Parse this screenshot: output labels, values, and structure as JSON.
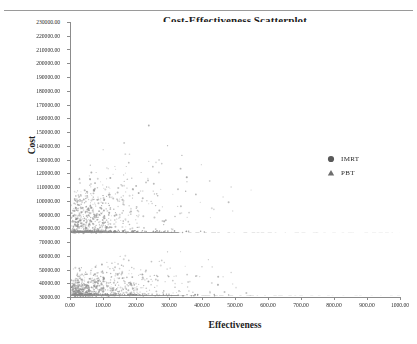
{
  "figure": {
    "title": "Cost-Effectiveness Scatterplot",
    "x_axis_title": "Effectiveness",
    "y_axis_title": "Cost"
  },
  "legend": {
    "items": [
      {
        "label": "IMRT",
        "marker": "filled-circle-icon",
        "color": "#595959"
      },
      {
        "label": "PBT",
        "marker": "filled-triangle-icon",
        "color": "#6e6e6e"
      }
    ]
  },
  "axes": {
    "y_tick_labels": [
      "230000.00",
      "220000.00",
      "210000.00",
      "200000.00",
      "190000.00",
      "180000.00",
      "170000.00",
      "160000.00",
      "150000.00",
      "140000.00",
      "130000.00",
      "120000.00",
      "110000.00",
      "100000.00",
      "90000.00",
      "80000.00",
      "70000.00",
      "60000.00",
      "50000.00",
      "40000.00",
      "30000.00"
    ],
    "x_tick_labels": [
      "0.00",
      "100.00",
      "200.00",
      "300.00",
      "400.00",
      "500.00",
      "600.00",
      "700.00",
      "800.00",
      "900.00",
      "1000.00"
    ]
  },
  "chart_data": {
    "type": "scatter",
    "title": "Cost-Effectiveness Scatterplot",
    "xlabel": "Effectiveness",
    "ylabel": "Cost",
    "xlim": [
      0,
      1000
    ],
    "ylim": [
      30000,
      230000
    ],
    "xtick_step": 100,
    "ytick_step": 10000,
    "grid": false,
    "legend_position": "right-middle",
    "marker_color": "#8a8a8a",
    "marker_size_px": 1.6,
    "series": [
      {
        "name": "PBT",
        "marker": "triangle",
        "color": "#8a8a8a",
        "n_points": 900,
        "floor_cost": 77500,
        "floor_fraction": 0.3,
        "cloud_description": "Dense wedge fanning upward-right from origin; most points below effectiveness 350 and cost 150000; sparse tail extends to effectiveness 900 and cost 225000.",
        "x_mode": 70,
        "x_decay": 165,
        "y_spread": 26000
      },
      {
        "name": "IMRT",
        "marker": "circle",
        "color": "#8a8a8a",
        "n_points": 900,
        "floor_cost": 31500,
        "floor_fraction": 0.33,
        "cloud_description": "Dense wedge fanning upward-right from origin, capped near cost 77000; highest density at effectiveness below 200.",
        "x_mode": 70,
        "x_decay": 165,
        "y_spread": 13000
      }
    ]
  }
}
